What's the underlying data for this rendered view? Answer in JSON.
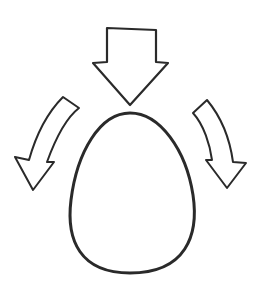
{
  "diagram": {
    "colors": {
      "background": "#ffffff",
      "stroke": "#2a2a2a"
    },
    "elements": [
      {
        "id": "top-arrow",
        "type": "straight-arrow",
        "direction": "down"
      },
      {
        "id": "left-arrow",
        "type": "curved-arrow",
        "direction": "down-left"
      },
      {
        "id": "right-arrow",
        "type": "curved-arrow",
        "direction": "down-right"
      },
      {
        "id": "egg",
        "type": "egg-shape"
      }
    ]
  }
}
